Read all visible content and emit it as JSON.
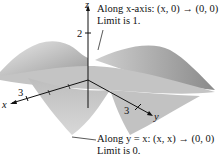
{
  "figure": {
    "axes": {
      "z_label": "z",
      "x_label": "x",
      "y_label": "y",
      "z_tick": "2",
      "x_tick": "3",
      "y_tick": "3"
    },
    "annotations": [
      {
        "line1": "Along x-axis:  (x, 0) → (0, 0)",
        "line2": "Limit is 1."
      },
      {
        "line1": "Along y = x:  (x, x) → (0, 0)",
        "line2": "Limit is 0."
      }
    ]
  }
}
